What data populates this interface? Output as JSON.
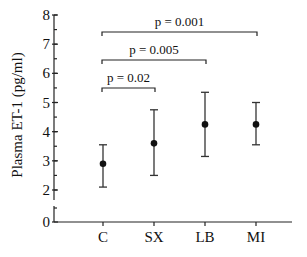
{
  "chart_data": {
    "type": "scatter",
    "subtype": "mean-with-error-bars",
    "title": "",
    "xlabel": "",
    "ylabel": "Plasma ET-1 (pg/ml)",
    "categories": [
      "C",
      "SX",
      "LB",
      "MI"
    ],
    "series": [
      {
        "name": "Plasma ET-1",
        "values": [
          2.9,
          3.6,
          4.25,
          4.25
        ],
        "error_upper": [
          3.55,
          4.75,
          5.35,
          5.0
        ],
        "error_lower": [
          2.1,
          2.5,
          3.15,
          3.55
        ]
      }
    ],
    "ylim": [
      0,
      8
    ],
    "y_axis_break": [
      0,
      2
    ],
    "yticks": [
      0,
      2,
      3,
      4,
      5,
      6,
      7,
      8
    ],
    "ytick_labels": [
      "0",
      "2",
      "3",
      "4",
      "5",
      "6",
      "7",
      "8"
    ],
    "y_minor_tick_step": 0.5,
    "grid": false,
    "legend": "none",
    "annotations": [
      {
        "from": "C",
        "to": "MI",
        "text": "p = 0.001",
        "level": 3
      },
      {
        "from": "C",
        "to": "LB",
        "text": "p = 0.005",
        "level": 2
      },
      {
        "from": "C",
        "to": "SX",
        "text": "p = 0.02",
        "level": 1
      }
    ]
  }
}
